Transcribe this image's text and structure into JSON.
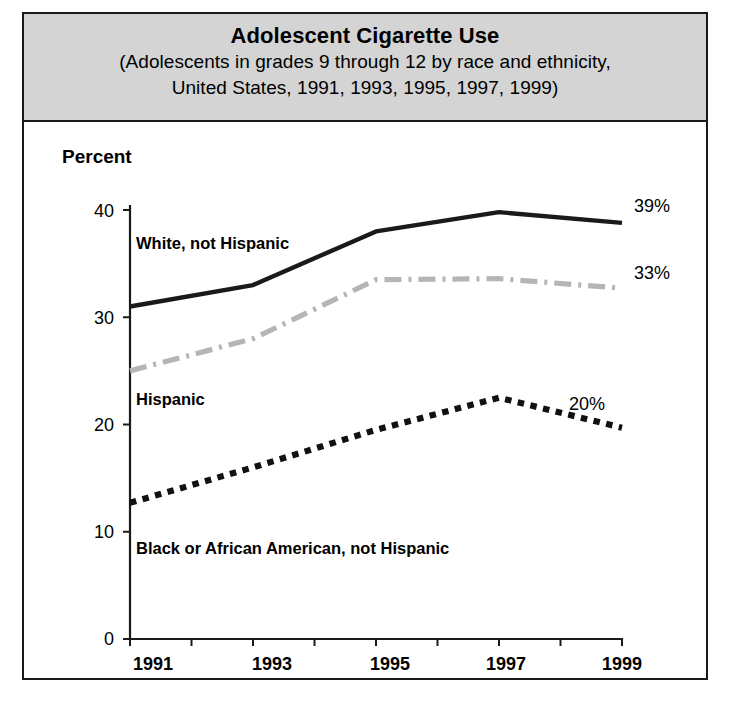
{
  "chart_data": {
    "type": "line",
    "title": "Adolescent Cigarette Use",
    "subtitle_line1": "(Adolescents in grades 9 through 12 by race and ethnicity,",
    "subtitle_line2": "United States, 1991, 1993, 1995, 1997, 1999)",
    "ylabel": "Percent",
    "xlabel": "",
    "x": [
      1991,
      1993,
      1995,
      1997,
      1999
    ],
    "categories": [
      "1991",
      "1993",
      "1995",
      "1997",
      "1999"
    ],
    "xtick_labels": [
      "1991",
      "1993",
      "1995",
      "1997",
      "1999"
    ],
    "ytick_labels": [
      "0",
      "10",
      "20",
      "30",
      "40"
    ],
    "ytick_values": [
      0,
      10,
      20,
      30,
      40
    ],
    "ylim": [
      0,
      41
    ],
    "xlim": [
      1991,
      1999.6
    ],
    "grid": false,
    "legend_position": "inline-annotations",
    "minor_xticks": [
      1992,
      1994,
      1996,
      1998
    ],
    "series": [
      {
        "name": "White, not Hispanic",
        "values": [
          31.0,
          33.0,
          38.0,
          39.8,
          38.8
        ],
        "style": "solid",
        "color": "#1a1a1a",
        "end_label": "39%",
        "inline_label": "White, not Hispanic"
      },
      {
        "name": "Hispanic",
        "values": [
          25.0,
          28.0,
          33.5,
          33.6,
          32.7
        ],
        "style": "dash-dot",
        "color": "#b5b5b5",
        "end_label": "33%",
        "inline_label": "Hispanic"
      },
      {
        "name": "Black or African American, not Hispanic",
        "values": [
          12.7,
          16.0,
          19.5,
          22.5,
          19.7
        ],
        "style": "dotted",
        "color": "#111111",
        "end_label": "20%",
        "inline_label": "Black or African American, not Hispanic"
      }
    ]
  },
  "colors": {
    "banner_background": "#d4d4d4",
    "frame": "#1a1a1a",
    "white_series": "#1a1a1a",
    "hispanic_series": "#b5b5b5",
    "black_series": "#111111"
  }
}
